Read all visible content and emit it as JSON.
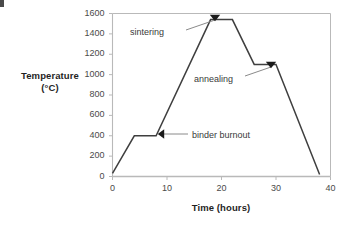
{
  "chart_data": {
    "type": "line",
    "title": "",
    "xlabel": "Time (hours)",
    "ylabel_line1": "Temperature",
    "ylabel_line2": "(°C)",
    "xlim": [
      0,
      40
    ],
    "ylim": [
      0,
      1600
    ],
    "xticks": [
      0,
      10,
      20,
      30,
      40
    ],
    "yticks": [
      0,
      200,
      400,
      600,
      800,
      1000,
      1200,
      1400,
      1600
    ],
    "xtick_labels": [
      "0",
      "10",
      "20",
      "30",
      "40"
    ],
    "ytick_labels": [
      "0",
      "200",
      "400",
      "600",
      "800",
      "1000",
      "1200",
      "1400",
      "1600"
    ],
    "grid": false,
    "legend": false,
    "series": [
      {
        "name": "thermal profile",
        "color": "#3f3f3f",
        "x": [
          0,
          4,
          8,
          18,
          22,
          26,
          30,
          38
        ],
        "y": [
          30,
          400,
          400,
          1540,
          1540,
          1100,
          1100,
          20
        ]
      }
    ],
    "annotations": [
      {
        "id": "sintering",
        "label": "sintering",
        "label_x": 130,
        "label_y": 27,
        "leader_from_x": 186,
        "leader_from_y": 30,
        "leader_to_x": 215,
        "leader_to_y": 20,
        "arrow_x": 215,
        "arrow_y": 20,
        "arrow_dir": "down"
      },
      {
        "id": "annealing",
        "label": "annealing",
        "label_x": 194,
        "label_y": 74,
        "leader_from_x": 245,
        "leader_from_y": 76,
        "leader_to_x": 271,
        "leader_to_y": 67,
        "arrow_x": 271,
        "arrow_y": 67,
        "arrow_dir": "down"
      },
      {
        "id": "binder-burnout",
        "label": "binder burnout",
        "label_x": 192,
        "label_y": 130,
        "leader_from_x": 188,
        "leader_from_y": 134,
        "leader_to_x": 159,
        "leader_to_y": 134,
        "arrow_x": 159,
        "arrow_y": 134,
        "arrow_dir": "left"
      }
    ],
    "style": {
      "axis_color": "#b9b9b9",
      "tick_color": "#b9b9b9",
      "line_color": "#3f3f3f",
      "annot_line_color": "#8a8a8a",
      "arrow_color": "#1a1a1a",
      "background": "#ffffff"
    }
  },
  "axis_labels": {
    "x_title": "Time (hours)",
    "y_title_line1": "Temperature",
    "y_title_line2": "(°C)"
  }
}
